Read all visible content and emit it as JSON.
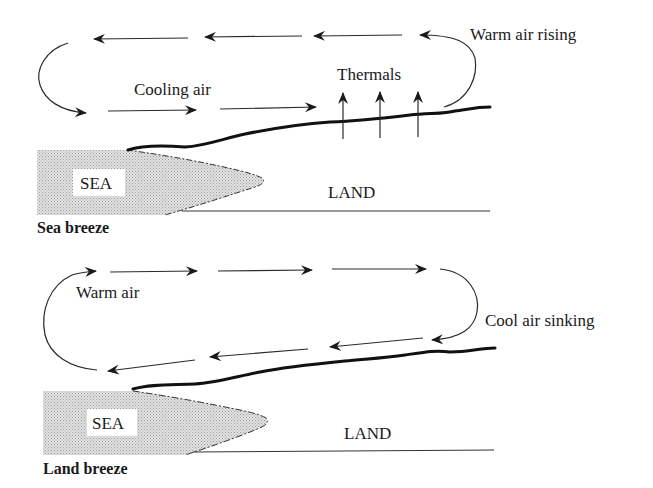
{
  "diagrams": [
    {
      "id": "sea-breeze",
      "caption": "Sea breeze",
      "labels": {
        "flow_top_right": "Warm air rising",
        "flow_bottom": "Cooling air",
        "thermals": "Thermals",
        "sea": "SEA",
        "land": "LAND"
      },
      "upper_flow_direction": "left",
      "lower_flow_direction": "right",
      "thermal_arrow_count": 3
    },
    {
      "id": "land-breeze",
      "caption": "Land breeze",
      "labels": {
        "flow_top_left": "Warm air",
        "flow_right": "Cool air sinking",
        "sea": "SEA",
        "land": "LAND"
      },
      "upper_flow_direction": "right",
      "lower_flow_direction": "left"
    }
  ],
  "colors": {
    "ink": "#1a1a1a",
    "sea_fill": "#d4d4d4",
    "background": "#ffffff"
  }
}
